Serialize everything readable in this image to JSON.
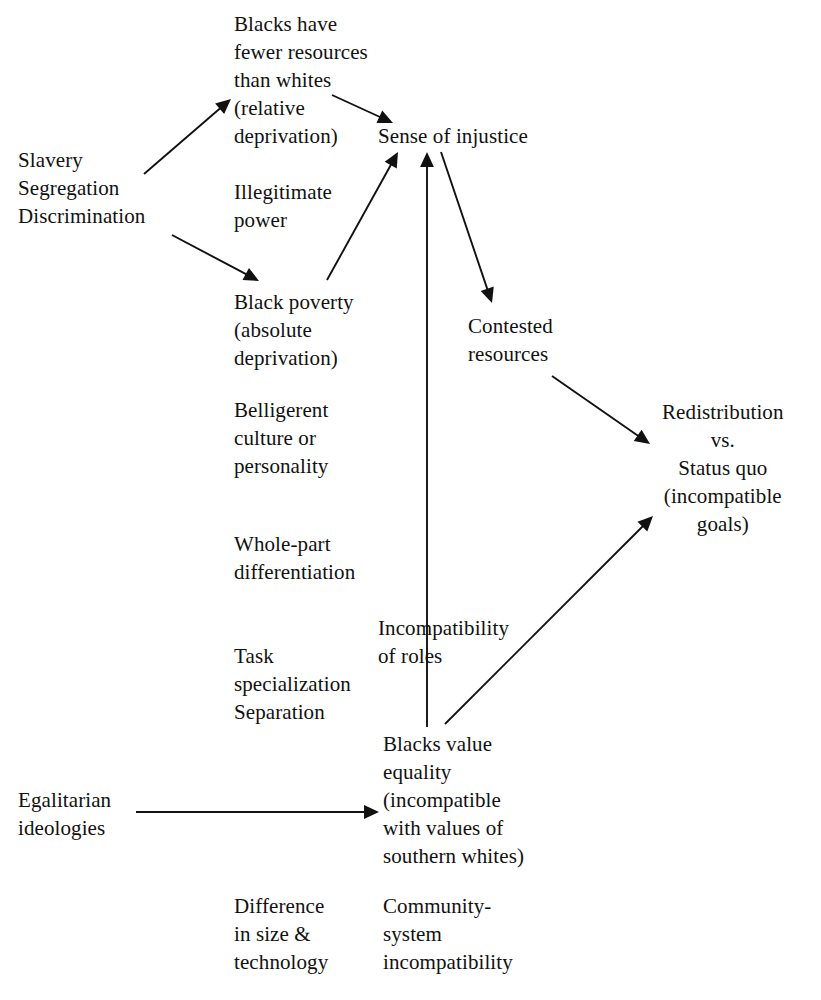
{
  "diagram": {
    "background_color": "#ffffff",
    "ink_color": "#111111",
    "width": 821,
    "height": 1000,
    "nodes": [
      {
        "id": "blacks-fewer-resources",
        "text": "Blacks have\nfewer resources\nthan whites\n(relative\ndeprivation)",
        "x": 234,
        "y": 10,
        "align": "left"
      },
      {
        "id": "slavery-segregation-discrimination",
        "text": "Slavery\n  Segregation\n    Discrimination",
        "x": 18,
        "y": 146,
        "align": "left"
      },
      {
        "id": "sense-of-injustice",
        "text": "Sense of injustice",
        "x": 378,
        "y": 122,
        "align": "left"
      },
      {
        "id": "illegitimate-power",
        "text": "Illegitimate\npower",
        "x": 234,
        "y": 178,
        "align": "left"
      },
      {
        "id": "black-poverty",
        "text": "Black poverty\n(absolute\ndeprivation)",
        "x": 234,
        "y": 288,
        "align": "left"
      },
      {
        "id": "contested-resources",
        "text": "Contested\nresources",
        "x": 468,
        "y": 312,
        "align": "left"
      },
      {
        "id": "belligerent-culture",
        "text": "Belligerent\nculture or\npersonality",
        "x": 234,
        "y": 396,
        "align": "left"
      },
      {
        "id": "redistribution-vs-status-quo",
        "text": "Redistribution\nvs.\nStatus quo\n(incompatible\ngoals)",
        "x": 662,
        "y": 398,
        "align": "center"
      },
      {
        "id": "whole-part-differentiation",
        "text": "Whole-part\ndifferentiation",
        "x": 234,
        "y": 530,
        "align": "left"
      },
      {
        "id": "incompatibility-of-roles",
        "text": "Incompatibility\nof roles",
        "x": 378,
        "y": 614,
        "align": "left"
      },
      {
        "id": "task-specialization-separation",
        "text": "Task\nspecialization\nSeparation",
        "x": 234,
        "y": 642,
        "align": "left"
      },
      {
        "id": "blacks-value-equality",
        "text": "Blacks value\nequality\n(incompatible\n  with values of\n  southern whites)",
        "x": 383,
        "y": 730,
        "align": "left"
      },
      {
        "id": "egalitarian-ideologies",
        "text": "Egalitarian\nideologies",
        "x": 18,
        "y": 786,
        "align": "left"
      },
      {
        "id": "difference-in-size-technology",
        "text": "Difference\nin size &\ntechnology",
        "x": 234,
        "y": 892,
        "align": "left"
      },
      {
        "id": "community-system-incompatibility",
        "text": "Community-\nsystem\nincompatibility",
        "x": 383,
        "y": 892,
        "align": "left"
      }
    ],
    "edges": [
      {
        "id": "edge-slavery-to-relative-deprivation",
        "from": "slavery-segregation-discrimination",
        "to": "blacks-fewer-resources",
        "x1": 144,
        "y1": 174,
        "x2": 231,
        "y2": 99,
        "arrow": "end"
      },
      {
        "id": "edge-slavery-to-black-poverty",
        "from": "slavery-segregation-discrimination",
        "to": "black-poverty",
        "x1": 172,
        "y1": 235,
        "x2": 259,
        "y2": 281,
        "arrow": "end"
      },
      {
        "id": "edge-relative-deprivation-to-sense-of-injustice",
        "from": "blacks-fewer-resources",
        "to": "sense-of-injustice",
        "x1": 332,
        "y1": 95,
        "x2": 393,
        "y2": 123,
        "arrow": "end"
      },
      {
        "id": "edge-black-poverty-to-sense-of-injustice",
        "from": "black-poverty",
        "to": "sense-of-injustice",
        "x1": 327,
        "y1": 280,
        "x2": 398,
        "y2": 152,
        "arrow": "end"
      },
      {
        "id": "edge-blacks-value-equality-to-sense-of-injustice",
        "from": "blacks-value-equality",
        "to": "sense-of-injustice",
        "x1": 427,
        "y1": 727,
        "x2": 427,
        "y2": 152,
        "arrow": "end"
      },
      {
        "id": "edge-sense-of-injustice-to-contested-resources",
        "from": "sense-of-injustice",
        "to": "contested-resources",
        "x1": 441,
        "y1": 152,
        "x2": 492,
        "y2": 303,
        "arrow": "end"
      },
      {
        "id": "edge-contested-resources-to-redistribution",
        "from": "contested-resources",
        "to": "redistribution-vs-status-quo",
        "x1": 552,
        "y1": 376,
        "x2": 650,
        "y2": 444,
        "arrow": "end"
      },
      {
        "id": "edge-blacks-value-equality-to-redistribution",
        "from": "blacks-value-equality",
        "to": "redistribution-vs-status-quo",
        "x1": 445,
        "y1": 724,
        "x2": 653,
        "y2": 516,
        "arrow": "end"
      },
      {
        "id": "edge-egalitarian-to-blacks-value-equality",
        "from": "egalitarian-ideologies",
        "to": "blacks-value-equality",
        "x1": 136,
        "y1": 812,
        "x2": 379,
        "y2": 812,
        "arrow": "end"
      }
    ]
  }
}
